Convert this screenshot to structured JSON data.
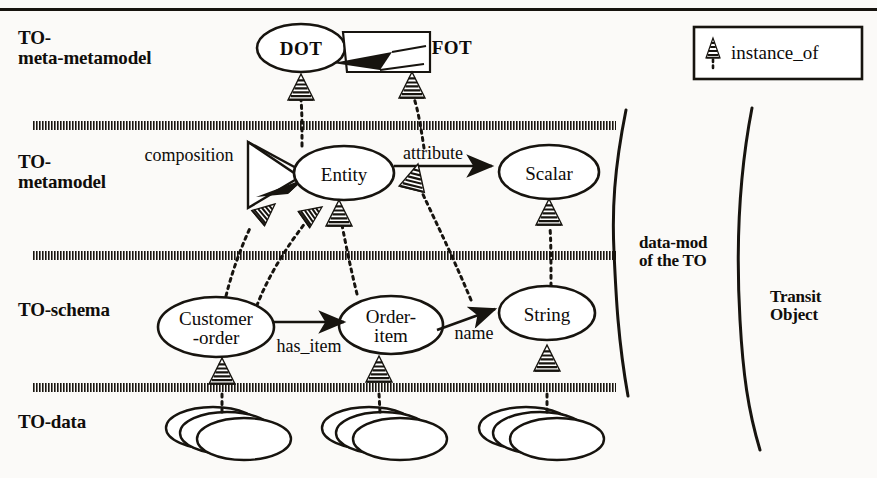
{
  "figure": {
    "type": "layered-metamodel-diagram",
    "background_color": "#fbfaf8",
    "ink_color": "#17140f"
  },
  "top_rule": {
    "name": "page-top-rule"
  },
  "layers": [
    {
      "id": "meta-metamodel",
      "label": "TO-\nmeta-metamodel",
      "x": 18,
      "y": 28
    },
    {
      "id": "metamodel",
      "label": "TO-\nmetamodel",
      "x": 18,
      "y": 152
    },
    {
      "id": "schema",
      "label": "TO-schema",
      "x": 18,
      "y": 300
    },
    {
      "id": "data",
      "label": "TO-data",
      "x": 18,
      "y": 412
    }
  ],
  "separators": [
    {
      "id": "sep-metameta-meta",
      "y": 126,
      "x1": 33,
      "x2": 616
    },
    {
      "id": "sep-meta-schema",
      "y": 256,
      "x1": 33,
      "x2": 616
    },
    {
      "id": "sep-schema-data",
      "y": 388,
      "x1": 33,
      "x2": 616
    }
  ],
  "nodes": [
    {
      "id": "dot",
      "label": "DOT",
      "shape": "ellipse",
      "cx": 301,
      "cy": 48,
      "rx": 44,
      "ry": 24,
      "bold": true
    },
    {
      "id": "fot",
      "label": "FOT",
      "shape": "trapezoid-label",
      "cx": 452,
      "cy": 47,
      "bold": true
    },
    {
      "id": "entity",
      "label": "Entity",
      "shape": "ellipse",
      "cx": 344,
      "cy": 173,
      "rx": 50,
      "ry": 27
    },
    {
      "id": "scalar",
      "label": "Scalar",
      "shape": "ellipse",
      "cx": 549,
      "cy": 172,
      "rx": 50,
      "ry": 27
    },
    {
      "id": "customer-order",
      "label": "Customer\n-order",
      "shape": "ellipse",
      "cx": 216,
      "cy": 327,
      "rx": 58,
      "ry": 30
    },
    {
      "id": "order-item",
      "label": "Order-\nitem",
      "shape": "ellipse",
      "cx": 391,
      "cy": 325,
      "rx": 52,
      "ry": 29
    },
    {
      "id": "string",
      "label": "String",
      "shape": "ellipse",
      "cx": 547,
      "cy": 313,
      "rx": 48,
      "ry": 27
    }
  ],
  "edge_labels": [
    {
      "id": "composition",
      "label": "composition",
      "x": 189,
      "y": 155
    },
    {
      "id": "attribute",
      "label": "attribute",
      "x": 433,
      "y": 153
    },
    {
      "id": "has_item",
      "label": "has_item",
      "x": 309,
      "y": 346
    },
    {
      "id": "name",
      "label": "name",
      "x": 474,
      "y": 333
    }
  ],
  "data_clusters": [
    {
      "id": "data-cluster-customer-order",
      "cx": 232,
      "cy": 435
    },
    {
      "id": "data-cluster-order-item",
      "cx": 388,
      "cy": 435
    },
    {
      "id": "data-cluster-string",
      "cx": 545,
      "cy": 435
    }
  ],
  "braces": [
    {
      "id": "brace-data-mod",
      "label": "data-mod\nof the TO",
      "label_x": 648,
      "label_y": 248
    },
    {
      "id": "brace-transit-object",
      "label": "Transit\nObject",
      "label_x": 780,
      "label_y": 300
    }
  ],
  "legend": {
    "name": "legend-box",
    "label": "instance_of",
    "x": 694,
    "y": 27,
    "width": 168,
    "height": 52,
    "symbol": "instance-of-arrow-icon"
  },
  "instance_of_arrows": [
    {
      "id": "io-dot-entity",
      "note": "Entity instance_of DOT"
    },
    {
      "id": "io-fot-attribute",
      "note": "attribute-relation instance_of FOT"
    },
    {
      "id": "io-entity-customer",
      "note": "Customer-order instance_of Entity"
    },
    {
      "id": "io-entity-orderitem",
      "note": "Order-item instance_of Entity"
    },
    {
      "id": "io-scalar-string",
      "note": "String instance_of Scalar"
    },
    {
      "id": "io-comp-hasitem",
      "note": "has_item instance_of composition"
    },
    {
      "id": "io-comp-name",
      "note": "name instance_of composition"
    },
    {
      "id": "io-data-customer",
      "note": "data instance_of Customer-order"
    },
    {
      "id": "io-data-orderitem",
      "note": "data instance_of Order-item"
    },
    {
      "id": "io-data-string",
      "note": "data instance_of String"
    }
  ]
}
